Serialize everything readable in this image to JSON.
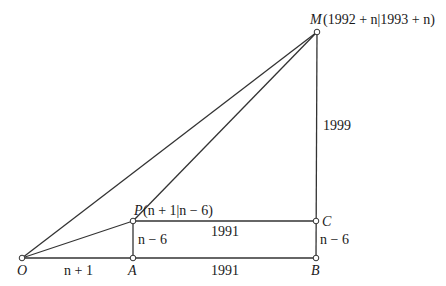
{
  "diagram": {
    "points": {
      "O": {
        "label": "O",
        "x": 22,
        "y": 258
      },
      "A": {
        "label": "A",
        "x": 133,
        "y": 258
      },
      "B": {
        "label": "B",
        "x": 316,
        "y": 258
      },
      "C": {
        "label": "C",
        "x": 316,
        "y": 221
      },
      "P": {
        "label": "P",
        "x": 133,
        "y": 221
      },
      "M": {
        "label": "M",
        "x": 317,
        "y": 32
      }
    },
    "coordinates": {
      "M": "(1992 + n|1993 + n)",
      "P": "(n + 1|n − 6)"
    },
    "segment_labels": {
      "OA": "n + 1",
      "AB": "1991",
      "PC": "1991",
      "AP": "n − 6",
      "BC": "n − 6",
      "CM": "1999"
    },
    "colors": {
      "stroke": "#333333",
      "text": "#1a1a1a",
      "background": "#ffffff"
    }
  }
}
